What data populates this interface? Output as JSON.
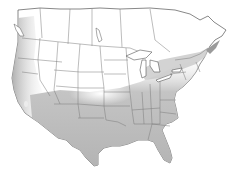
{
  "map": {
    "region": "North America (United States and southern Canada)",
    "type": "range map",
    "colors": {
      "background": "#ffffff",
      "land": "#ffffff",
      "range_fill": "#b8b8b8",
      "range_light": "#d6d6d6",
      "border": "#6e6e6e",
      "coast": "#555555"
    },
    "shaded_regions": [
      "west-coast",
      "southwest",
      "south",
      "southeast",
      "east",
      "great-lakes"
    ],
    "labels": []
  }
}
